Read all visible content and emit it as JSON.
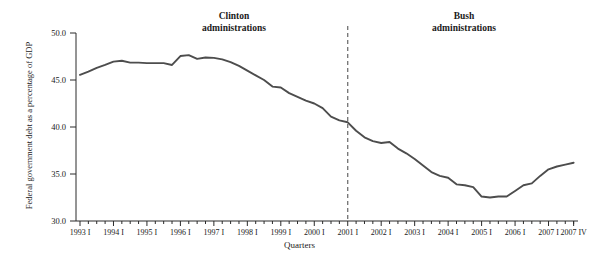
{
  "chart_data": {
    "type": "line",
    "title": "",
    "xlabel": "Quarters",
    "ylabel": "Federal government debt as a percentage of GDP",
    "ylim": [
      30.0,
      50.0
    ],
    "ytick_labels": [
      "50.0",
      "45.0",
      "40.0",
      "35.0",
      "30.0"
    ],
    "ytick_values": [
      50.0,
      45.0,
      40.0,
      35.0,
      30.0
    ],
    "grid": false,
    "legend": "none",
    "line_color": "#4d4d4d",
    "x_labels": [
      "1993 I",
      "1994 I",
      "1995 I",
      "1996 I",
      "1997 I",
      "1998 I",
      "1999 I",
      "2000 I",
      "2001 I",
      "2002 I",
      "2003 I",
      "2004 I",
      "2005 I",
      "2006 I",
      "2007 I",
      "2007 IV"
    ],
    "x": [
      "1993 I",
      "1993 II",
      "1993 III",
      "1993 IV",
      "1994 I",
      "1994 II",
      "1994 III",
      "1994 IV",
      "1995 I",
      "1995 II",
      "1995 III",
      "1995 IV",
      "1996 I",
      "1996 II",
      "1996 III",
      "1996 IV",
      "1997 I",
      "1997 II",
      "1997 III",
      "1997 IV",
      "1998 I",
      "1998 II",
      "1998 III",
      "1998 IV",
      "1999 I",
      "1999 II",
      "1999 III",
      "1999 IV",
      "2000 I",
      "2000 II",
      "2000 III",
      "2000 IV",
      "2001 I",
      "2001 II",
      "2001 III",
      "2001 IV",
      "2002 I",
      "2002 II",
      "2002 III",
      "2002 IV",
      "2003 I",
      "2003 II",
      "2003 III",
      "2003 IV",
      "2004 I",
      "2004 II",
      "2004 III",
      "2004 IV",
      "2005 I",
      "2005 II",
      "2005 III",
      "2005 IV",
      "2006 I",
      "2006 II",
      "2006 III",
      "2006 IV",
      "2007 I",
      "2007 II",
      "2007 III",
      "2007 IV"
    ],
    "values": [
      45.5,
      45.8,
      46.2,
      46.5,
      46.9,
      47.1,
      46.9,
      46.9,
      46.8,
      46.8,
      46.8,
      46.6,
      47.6,
      47.7,
      47.3,
      47.4,
      47.4,
      47.3,
      47.0,
      46.6,
      46.1,
      45.6,
      45.1,
      44.6,
      44.4,
      43.7,
      43.2,
      42.8,
      42.4,
      41.9,
      41.0,
      40.6,
      40.5,
      39.7,
      39.0,
      38.6,
      38.4,
      38.5,
      37.8,
      37.3,
      33.6,
      33.4,
      33.0,
      32.4,
      32.5,
      32.5,
      32.6,
      33.0,
      33.6,
      33.9,
      33.6,
      34.6,
      35.0,
      35.3,
      35.5,
      36.0,
      36.2,
      36.1,
      36.4,
      36.5
    ],
    "series_values_plot": [
      45.55,
      45.9,
      46.3,
      46.6,
      46.95,
      47.05,
      46.85,
      46.85,
      46.8,
      46.8,
      46.8,
      46.6,
      47.55,
      47.65,
      47.25,
      47.4,
      47.35,
      47.2,
      46.9,
      46.5,
      46.0,
      45.5,
      45.0,
      44.3,
      44.2,
      43.6,
      43.2,
      42.8,
      42.5,
      42.0,
      41.1,
      40.7,
      40.5,
      39.6,
      38.9,
      38.5,
      38.3,
      38.4,
      37.7,
      37.2,
      36.6,
      35.9,
      35.2,
      34.8,
      34.6,
      33.9,
      33.8,
      33.6,
      32.6,
      32.5,
      32.6,
      32.6,
      33.2,
      33.8,
      34.0,
      34.8,
      35.5,
      35.8,
      36.0,
      36.2
    ],
    "annotations": [
      {
        "id": "clinton",
        "line1": "Clinton",
        "line2": "administrations"
      },
      {
        "id": "bush",
        "line1": "Bush",
        "line2": "administrations"
      }
    ],
    "divider": {
      "at_label": "2001 I",
      "style": "dashed",
      "color": "#666666"
    }
  }
}
